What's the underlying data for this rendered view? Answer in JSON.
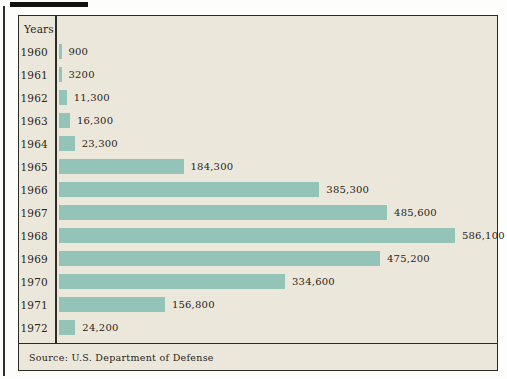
{
  "figure": {
    "years_header": "Years",
    "source": "Source: U.S. Department of Defense"
  },
  "chart_data": {
    "type": "bar",
    "orientation": "horizontal",
    "title": "",
    "category_axis_label": "Years",
    "categories": [
      "1960",
      "1961",
      "1962",
      "1963",
      "1964",
      "1965",
      "1966",
      "1967",
      "1968",
      "1969",
      "1970",
      "1971",
      "1972"
    ],
    "values": [
      900,
      3200,
      11300,
      16300,
      23300,
      184300,
      385300,
      485600,
      586100,
      475200,
      334600,
      156800,
      24200
    ],
    "value_labels": [
      "900",
      "3200",
      "11,300",
      "16,300",
      "23,300",
      "184,300",
      "385,300",
      "485,600",
      "586,100",
      "475,200",
      "334,600",
      "156,800",
      "24,200"
    ],
    "xlim": [
      0,
      600000
    ],
    "grid": false,
    "legend": "none",
    "source_note": "Source: U.S. Department of Defense",
    "bar_color": "#94c4b8",
    "background_color": "#ebe7da",
    "border_color": "#2c2c27"
  }
}
